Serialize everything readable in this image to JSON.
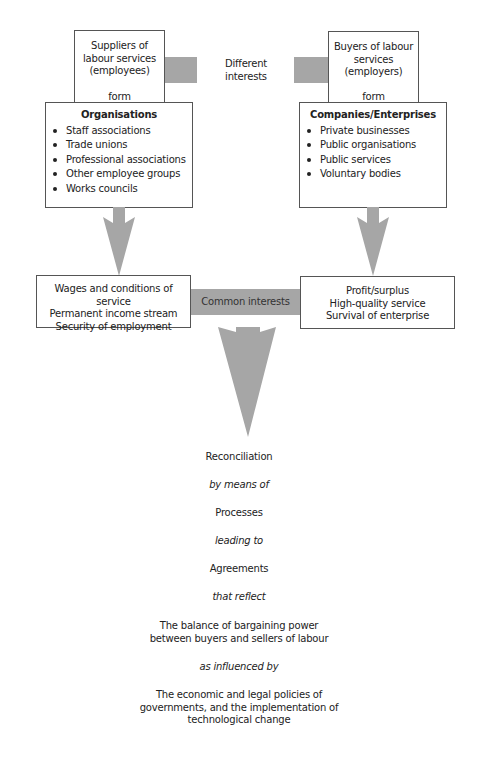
{
  "diagram": {
    "left": {
      "top_box": {
        "line1": "Suppliers of",
        "line2": "labour services",
        "line3": "(employees)",
        "form": "form"
      },
      "org_box": {
        "title": "Organisations",
        "items": [
          "Staff associations",
          "Trade unions",
          "Professional associations",
          "Other employee groups",
          "Works councils"
        ]
      },
      "interests_box": {
        "lines": [
          "Wages and conditions of service",
          "Permanent income stream",
          "Security of employment"
        ]
      }
    },
    "right": {
      "top_box": {
        "line1": "Buyers of labour",
        "line2": "services",
        "line3": "(employers)",
        "form": "form"
      },
      "org_box": {
        "title": "Companies/Enterprises",
        "items": [
          "Private businesses",
          "Public organisations",
          "Public services",
          "Voluntary bodies"
        ]
      },
      "interests_box": {
        "lines": [
          "Profit/surplus",
          "High-quality service",
          "Survival of enterprise"
        ]
      }
    },
    "connectors": {
      "different": {
        "line1": "Different",
        "line2": "interests"
      },
      "common": "Common interests"
    },
    "flow": {
      "reconciliation": "Reconciliation",
      "by_means_of": "by means of",
      "processes": "Processes",
      "leading_to": "leading to",
      "agreements": "Agreements",
      "that_reflect": "that reflect",
      "balance": [
        "The balance of bargaining power",
        "between buyers and sellers of labour"
      ],
      "as_influenced_by": "as influenced by",
      "policies": [
        "The economic and legal policies of",
        "governments, and the implementation of",
        "technological change"
      ]
    },
    "colors": {
      "connector_grey": "#a6a6a6",
      "border": "#555555"
    }
  }
}
